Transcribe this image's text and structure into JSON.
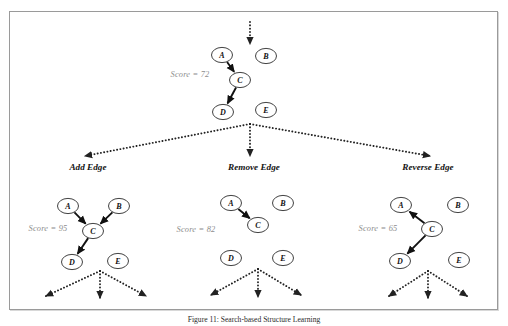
{
  "figure": {
    "caption": "Figure 11: Search-based Structure Learning",
    "frame_border_color": "#9a9a9a",
    "node_stroke_color": "#2b2b2b",
    "edge_color": "#111111",
    "dotted_edge_color": "#222222",
    "score_color": "#8d8d8d"
  },
  "root_state": {
    "score_label": "Score = 72",
    "nodes": [
      {
        "id": "A",
        "label": "A",
        "cx": 222,
        "cy": 55
      },
      {
        "id": "B",
        "label": "B",
        "cx": 266,
        "cy": 56
      },
      {
        "id": "C",
        "label": "C",
        "cx": 240,
        "cy": 80
      },
      {
        "id": "D",
        "label": "D",
        "cx": 223,
        "cy": 112
      },
      {
        "id": "E",
        "label": "E",
        "cx": 266,
        "cy": 110
      }
    ],
    "edges": [
      {
        "from": "A",
        "to": "C"
      },
      {
        "from": "C",
        "to": "D"
      }
    ],
    "score_x": 190,
    "score_y": 74
  },
  "incoming_arrow": {
    "x": 250,
    "y_start": 22,
    "y_end": 44
  },
  "branch_fan": {
    "origin_x": 250,
    "origin_y": 124,
    "targets": [
      {
        "x": 85,
        "y": 156
      },
      {
        "x": 250,
        "y": 156
      },
      {
        "x": 430,
        "y": 156
      }
    ]
  },
  "operators": [
    {
      "name": "add-edge",
      "op_label": "Add Edge",
      "op_x": 88,
      "op_y": 167,
      "score_label": "Score = 95",
      "score_x": 48,
      "score_y": 228,
      "nodes": [
        {
          "id": "A",
          "label": "A",
          "cx": 68,
          "cy": 206
        },
        {
          "id": "B",
          "label": "B",
          "cx": 119,
          "cy": 206
        },
        {
          "id": "C",
          "label": "C",
          "cx": 93,
          "cy": 231
        },
        {
          "id": "D",
          "label": "D",
          "cx": 72,
          "cy": 262
        },
        {
          "id": "E",
          "label": "E",
          "cx": 118,
          "cy": 261
        }
      ],
      "edges": [
        {
          "from": "A",
          "to": "C"
        },
        {
          "from": "B",
          "to": "C"
        },
        {
          "from": "C",
          "to": "D"
        }
      ],
      "fan": {
        "origin_x": 100,
        "origin_y": 271,
        "targets": [
          {
            "x": 46,
            "y": 296
          },
          {
            "x": 100,
            "y": 298
          },
          {
            "x": 146,
            "y": 296
          }
        ]
      }
    },
    {
      "name": "remove-edge",
      "op_label": "Remove Edge",
      "op_x": 254,
      "op_y": 167,
      "score_label": "Score = 82",
      "score_x": 196,
      "score_y": 229,
      "nodes": [
        {
          "id": "A",
          "label": "A",
          "cx": 231,
          "cy": 203
        },
        {
          "id": "B",
          "label": "B",
          "cx": 283,
          "cy": 203
        },
        {
          "id": "C",
          "label": "C",
          "cx": 258,
          "cy": 225
        },
        {
          "id": "D",
          "label": "D",
          "cx": 231,
          "cy": 258
        },
        {
          "id": "E",
          "label": "E",
          "cx": 283,
          "cy": 258
        }
      ],
      "edges": [
        {
          "from": "A",
          "to": "C"
        }
      ],
      "fan": {
        "origin_x": 258,
        "origin_y": 269,
        "targets": [
          {
            "x": 211,
            "y": 295
          },
          {
            "x": 258,
            "y": 297
          },
          {
            "x": 301,
            "y": 295
          }
        ]
      }
    },
    {
      "name": "reverse-edge",
      "op_label": "Reverse Edge",
      "op_x": 428,
      "op_y": 167,
      "score_label": "Score = 65",
      "score_x": 378,
      "score_y": 228,
      "nodes": [
        {
          "id": "A",
          "label": "A",
          "cx": 401,
          "cy": 205
        },
        {
          "id": "B",
          "label": "B",
          "cx": 458,
          "cy": 205
        },
        {
          "id": "C",
          "label": "C",
          "cx": 432,
          "cy": 229
        },
        {
          "id": "D",
          "label": "D",
          "cx": 400,
          "cy": 261
        },
        {
          "id": "E",
          "label": "E",
          "cx": 459,
          "cy": 260
        }
      ],
      "edges": [
        {
          "from": "C",
          "to": "A"
        },
        {
          "from": "C",
          "to": "D"
        }
      ],
      "fan": {
        "origin_x": 428,
        "origin_y": 271,
        "targets": [
          {
            "x": 389,
            "y": 296
          },
          {
            "x": 428,
            "y": 298
          },
          {
            "x": 467,
            "y": 296
          }
        ]
      }
    }
  ]
}
